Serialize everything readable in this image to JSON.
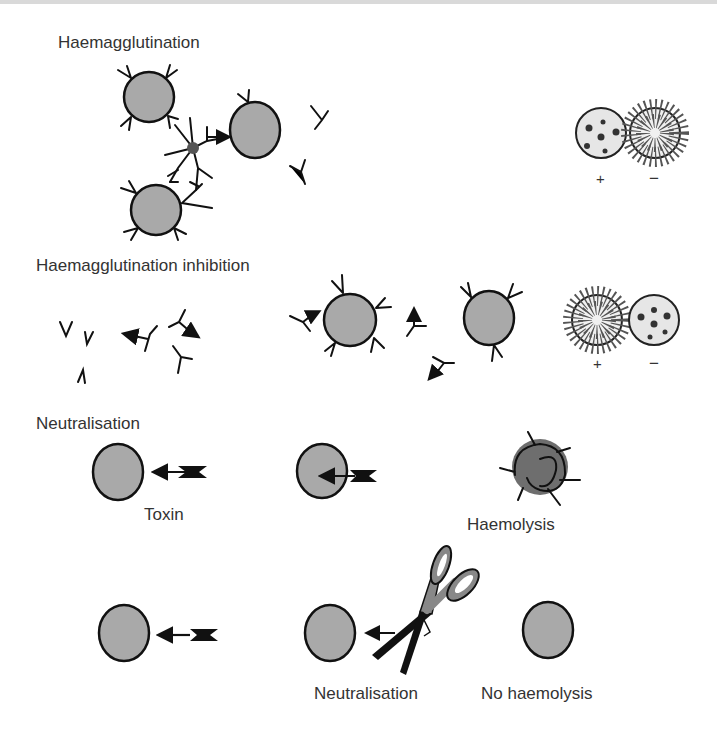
{
  "sections": {
    "haemagglutination": {
      "title": "Haemagglutination",
      "result_plus": "+",
      "result_minus": "−"
    },
    "hai": {
      "title": "Haemagglutination inhibition",
      "result_plus": "+",
      "result_minus": "−"
    },
    "neutralisation": {
      "title": "Neutralisation",
      "toxin_label": "Toxin",
      "haemolysis_label": "Haemolysis"
    },
    "neutralised": {
      "neutralisation_label": "Neutralisation",
      "no_haemolysis_label": "No haemolysis"
    }
  },
  "colors": {
    "cell_fill": "#a9a9a9",
    "outline": "#111111",
    "hub": "#555555",
    "lysed_cell": "#6e6e6e",
    "well_fill": "#e6e6e6",
    "text": "#333333"
  }
}
